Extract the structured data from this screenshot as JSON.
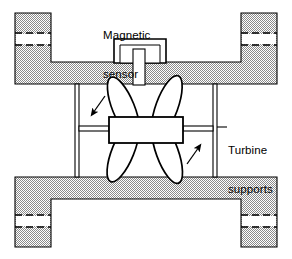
{
  "figure": {
    "kind": "turbine-flowmeter-cross-section",
    "background_color": "#ffffff",
    "line_color": "#000000",
    "hatch_color": "#808080"
  },
  "labels": {
    "magnetic_sensor": {
      "line1": "Magnetic",
      "line2": "sensor"
    },
    "turbine_supports": {
      "line1": "Turbine",
      "line2": "supports"
    }
  },
  "parts": {
    "pipe_body": "pipe-body",
    "left_flange": "left-flange",
    "right_flange": "right-flange",
    "sensor_housing": "magnetic-sensor-housing",
    "sensor_stem": "magnetic-sensor-stem",
    "rotor_hub": "turbine-rotor-hub",
    "rotor_blades": "turbine-rotor-blades",
    "left_support": "turbine-support-left",
    "right_support": "turbine-support-right",
    "rotation_arrow_left": "rotation-arrow-left",
    "rotation_arrow_right": "rotation-arrow-right",
    "leader_line": "turbine-supports-leader-line"
  },
  "geometry": {
    "canvas_width": 292,
    "canvas_height": 259,
    "pipe_left": 15,
    "pipe_right": 277,
    "bore_top": 84,
    "bore_bottom": 177,
    "wall_outer_top": 62,
    "wall_outer_bottom": 199,
    "flange_width": 36,
    "blade_count": 4
  }
}
